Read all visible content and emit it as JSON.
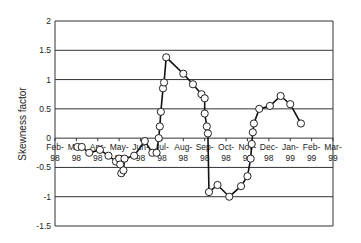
{
  "chart_data": {
    "type": "line",
    "title": "",
    "xlabel": "",
    "ylabel": "Skewness factor",
    "ylim": [
      -1.5,
      2
    ],
    "yticks": [
      "2",
      "1.5",
      "1",
      "0.5",
      "0",
      "-0.5",
      "-1",
      "-1.5"
    ],
    "grid": true,
    "legend": null,
    "x_categories": [
      "Feb-98",
      "Mar-98",
      "Apr-98",
      "May-98",
      "Jun-98",
      "Jul-98",
      "Aug-98",
      "Sep-98",
      "Oct-98",
      "Nov-98",
      "Dec-98",
      "Jan-99",
      "Feb-99",
      "Mar-99"
    ],
    "x_tick_labels": [
      {
        "top": "Feb-",
        "bottom": "98"
      },
      {
        "top": "Mar-",
        "bottom": "98"
      },
      {
        "top": "Apr-",
        "bottom": "98"
      },
      {
        "top": "May-",
        "bottom": "98"
      },
      {
        "top": "Jun-",
        "bottom": "98"
      },
      {
        "top": "Jul-",
        "bottom": "98"
      },
      {
        "top": "Aug-",
        "bottom": "98"
      },
      {
        "top": "Sep-",
        "bottom": "98"
      },
      {
        "top": "Oct-",
        "bottom": "98"
      },
      {
        "top": "Nov-",
        "bottom": "98"
      },
      {
        "top": "Dec-",
        "bottom": "98"
      },
      {
        "top": "Jan-",
        "bottom": "99"
      },
      {
        "top": "Feb-",
        "bottom": "99"
      },
      {
        "top": "Mar-",
        "bottom": "99"
      }
    ],
    "series": [
      {
        "name": "Skewness factor",
        "marker": "open-circle",
        "points": [
          {
            "x": 1.05,
            "y": -0.15
          },
          {
            "x": 1.25,
            "y": -0.15
          },
          {
            "x": 1.6,
            "y": -0.25
          },
          {
            "x": 2.1,
            "y": -0.2
          },
          {
            "x": 2.5,
            "y": -0.3
          },
          {
            "x": 2.85,
            "y": -0.4
          },
          {
            "x": 3.0,
            "y": -0.35
          },
          {
            "x": 3.05,
            "y": -0.45
          },
          {
            "x": 3.1,
            "y": -0.6
          },
          {
            "x": 3.2,
            "y": -0.55
          },
          {
            "x": 3.25,
            "y": -0.35
          },
          {
            "x": 3.7,
            "y": -0.3
          },
          {
            "x": 4.2,
            "y": -0.05
          },
          {
            "x": 4.55,
            "y": -0.25
          },
          {
            "x": 4.75,
            "y": -0.25
          },
          {
            "x": 4.85,
            "y": 0.0
          },
          {
            "x": 4.9,
            "y": 0.2
          },
          {
            "x": 4.95,
            "y": 0.45
          },
          {
            "x": 5.05,
            "y": 0.85
          },
          {
            "x": 5.1,
            "y": 0.95
          },
          {
            "x": 5.2,
            "y": 1.38
          },
          {
            "x": 6.0,
            "y": 1.1
          },
          {
            "x": 6.45,
            "y": 0.92
          },
          {
            "x": 6.85,
            "y": 0.75
          },
          {
            "x": 7.0,
            "y": 0.68
          },
          {
            "x": 7.0,
            "y": 0.42
          },
          {
            "x": 7.1,
            "y": 0.2
          },
          {
            "x": 7.15,
            "y": 0.08
          },
          {
            "x": 7.2,
            "y": -0.92
          },
          {
            "x": 7.6,
            "y": -0.8
          },
          {
            "x": 8.15,
            "y": -1.0
          },
          {
            "x": 8.7,
            "y": -0.82
          },
          {
            "x": 9.0,
            "y": -0.65
          },
          {
            "x": 9.15,
            "y": -0.35
          },
          {
            "x": 9.2,
            "y": -0.1
          },
          {
            "x": 9.25,
            "y": 0.1
          },
          {
            "x": 9.3,
            "y": 0.25
          },
          {
            "x": 9.55,
            "y": 0.5
          },
          {
            "x": 10.05,
            "y": 0.55
          },
          {
            "x": 10.55,
            "y": 0.72
          },
          {
            "x": 11.0,
            "y": 0.58
          },
          {
            "x": 11.5,
            "y": 0.25
          }
        ]
      }
    ]
  }
}
